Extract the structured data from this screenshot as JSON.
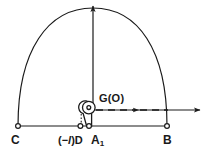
{
  "figure": {
    "background_color": "#ffffff",
    "stroke_color": "#1a1a1a",
    "labels": {
      "point_c": "C",
      "point_d_prefix": "(−",
      "point_d_italic": "l",
      "point_d_suffix": ")D",
      "point_a1_base": "A",
      "point_a1_sub": "1",
      "point_b": "B",
      "pivot": "G(O)"
    },
    "points": {
      "c": {
        "x": 18,
        "y": 126,
        "marker": "open-circle"
      },
      "d": {
        "x": 80,
        "y": 126,
        "marker": "open-circle"
      },
      "a1": {
        "x": 89,
        "y": 126,
        "marker": "open-circle"
      },
      "b": {
        "x": 167,
        "y": 126,
        "marker": "open-circle"
      },
      "g": {
        "x": 89,
        "y": 108,
        "marker": "dot-in-circle"
      }
    },
    "axes": {
      "vertical_axis_x": 93,
      "vertical_axis_top_y": 4,
      "vertical_axis_bottom_y": 108,
      "horizontal_axis_y": 110,
      "horizontal_axis_right_x": 201,
      "baseline_y": 126,
      "baseline_left_x": 18,
      "baseline_right_x": 167
    },
    "arc": {
      "center_x": 93,
      "center_y": 126,
      "radius_x": 75,
      "radius_y": 96,
      "start_label": "C",
      "end_label": "B"
    },
    "dashed_arrow": {
      "from_x": 95,
      "to_x": 170,
      "y": 110,
      "dash_pattern": "7,5",
      "midpoint_arrow_x": 137
    }
  }
}
